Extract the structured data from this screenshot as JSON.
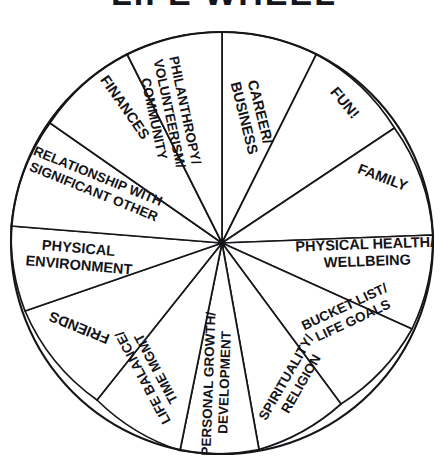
{
  "title": "LIFE WHEEL",
  "wheel": {
    "center_x": 222,
    "center_y": 243,
    "radius": 211,
    "segment_count": 12,
    "stroke_color": "#16161a",
    "fill_color": "#ffffff",
    "segments": [
      {
        "id": "career-business",
        "label": "CAREER/ BUSINESS",
        "line1": "CAREER/",
        "line2": "BUSINESS",
        "line3": ""
      },
      {
        "id": "fun",
        "label": "FUN!",
        "line1": "FUN!",
        "line2": "",
        "line3": ""
      },
      {
        "id": "family",
        "label": "FAMILY",
        "line1": "FAMILY",
        "line2": "",
        "line3": ""
      },
      {
        "id": "physical-health",
        "label": "PHYSICAL HEALTH/ WELLBEING",
        "line1": "PHYSICAL HEALTH/",
        "line2": "WELLBEING",
        "line3": ""
      },
      {
        "id": "bucket-list",
        "label": "BUCKET LIST/ LIFE GOALS",
        "line1": "BUCKET LIST/",
        "line2": "LIFE GOALS",
        "line3": ""
      },
      {
        "id": "spirituality-religion",
        "label": "SPIRITUALITY/ RELIGION",
        "line1": "SPIRITUALITY/",
        "line2": "RELIGION",
        "line3": ""
      },
      {
        "id": "personal-growth",
        "label": "PERSONAL GROWTH/ DEVELOPMENT",
        "line1": "PERSONAL GROWTH/",
        "line2": "DEVELOPMENT",
        "line3": ""
      },
      {
        "id": "life-balance",
        "label": "LIFE BALANCE/ TIME MGMT",
        "line1": "LIFE BALANCE/",
        "line2": "TIME MGMT",
        "line3": ""
      },
      {
        "id": "friends",
        "label": "FRIENDS",
        "line1": "FRIENDS",
        "line2": "",
        "line3": ""
      },
      {
        "id": "physical-environment",
        "label": "PHYSICAL ENVIRONMENT",
        "line1": "PHYSICAL",
        "line2": "ENVIRONMENT",
        "line3": ""
      },
      {
        "id": "relationship-so",
        "label": "RELATIONSHIP WITH SIGNIFICANT OTHER",
        "line1": "RELATIONSHIP WITH",
        "line2": "SIGNIFICANT OTHER",
        "line3": ""
      },
      {
        "id": "finances",
        "label": "FINANCES",
        "line1": "FINANCES",
        "line2": "",
        "line3": ""
      },
      {
        "id": "philanthropy",
        "label": "PHILANTHROPY/ VOLUNTEERISM/ COMMUNITY",
        "line1": "PHILANTHROPY/",
        "line2": "VOLUNTEERISM/",
        "line3": "COMMUNITY"
      }
    ]
  }
}
